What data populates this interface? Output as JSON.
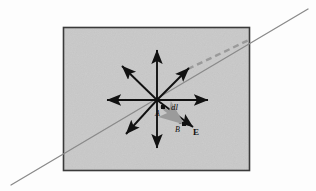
{
  "figure": {
    "title": "",
    "background_color": "#fdfdfd",
    "canvas": {
      "width": 316,
      "height": 191
    }
  },
  "plane_region": {
    "name": "shaded-plane",
    "fill_color": "#c9c9c9",
    "border_color": "#3a3a3a",
    "x": 63,
    "y": 27,
    "width": 187,
    "height": 144
  },
  "field_line": {
    "name": "field-line",
    "color": "#8a8a8a",
    "x1": 11,
    "y1": 185,
    "x2": 308,
    "y2": 9
  },
  "dashed_extension": {
    "name": "dashed-extension",
    "color": "#9a9a9a",
    "x1": 188,
    "y1": 69,
    "x2": 251,
    "y2": 39
  },
  "origin": {
    "x": 157,
    "y": 100
  },
  "vectors": [
    {
      "name": "arrow-up",
      "x2": 157,
      "y2": 50,
      "color": "#111111"
    },
    {
      "name": "arrow-down",
      "x2": 157,
      "y2": 148,
      "color": "#111111"
    },
    {
      "name": "arrow-left",
      "x2": 107,
      "y2": 100,
      "color": "#111111"
    },
    {
      "name": "arrow-right",
      "x2": 208,
      "y2": 100,
      "color": "#111111"
    },
    {
      "name": "arrow-upper-left",
      "x2": 122,
      "y2": 66,
      "color": "#111111"
    },
    {
      "name": "arrow-lower-left",
      "x2": 126,
      "y2": 134,
      "color": "#111111"
    },
    {
      "name": "arrow-upper-right",
      "x2": 189,
      "y2": 68,
      "color": "#111111"
    },
    {
      "name": "arrow-lower-right",
      "x2": 193,
      "y2": 127,
      "color": "#111111"
    }
  ],
  "displacement_vector": {
    "name": "dl-vector",
    "color": "#9b9b9b",
    "x1": 162,
    "y1": 107,
    "x2": 184,
    "y2": 124
  },
  "point_markers": [
    {
      "name": "point-a-marker",
      "x": 163,
      "y": 107
    },
    {
      "name": "point-b-marker",
      "x": 184,
      "y": 124
    }
  ],
  "labels": [
    {
      "name": "label-a",
      "text": "A",
      "x": 155,
      "y": 110,
      "style": "italic",
      "size": 8
    },
    {
      "name": "label-dl",
      "text": "dl",
      "x": 171,
      "y": 103,
      "style": "italic",
      "size": 9
    },
    {
      "name": "label-b",
      "text": "B",
      "x": 175,
      "y": 126,
      "style": "italic",
      "size": 8
    },
    {
      "name": "label-e",
      "text": "E",
      "x": 193,
      "y": 128,
      "style": "bold",
      "size": 9
    }
  ],
  "chart_data": {
    "type": "scatter",
    "xlabel": "",
    "ylabel": "",
    "annotations": [
      "A",
      "dl",
      "B",
      "E"
    ],
    "series": [
      {
        "name": "vector-star-tips",
        "x": [
          157,
          157,
          107,
          208,
          122,
          126,
          189,
          193
        ],
        "y": [
          50,
          148,
          100,
          100,
          66,
          134,
          68,
          127
        ]
      },
      {
        "name": "displacement-dl",
        "x": [
          162,
          184
        ],
        "y": [
          107,
          124
        ]
      },
      {
        "name": "field-line-E",
        "x": [
          11,
          308
        ],
        "y": [
          185,
          9
        ]
      }
    ],
    "grid": false,
    "legend": "none"
  }
}
